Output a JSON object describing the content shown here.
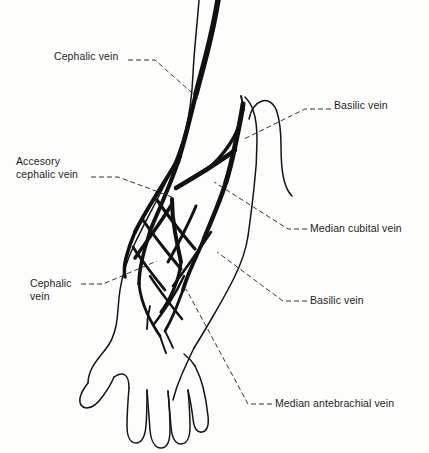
{
  "figure": {
    "background_color": "#fdfdfc",
    "ink_color": "#141414",
    "leader_style": "dashed"
  },
  "labels": [
    {
      "id": "cephalic-vein-upper",
      "text": "Cephalic vein",
      "x": 54,
      "y": 56,
      "anchor": "left"
    },
    {
      "id": "basilic-vein-upper",
      "text": "Basilic vein",
      "x": 334,
      "y": 105,
      "anchor": "left"
    },
    {
      "id": "accessory-cephalic-vein",
      "text": "Accesory\ncephalic vein",
      "x": 16,
      "y": 155,
      "anchor": "left"
    },
    {
      "id": "median-cubital-vein",
      "text": "Median cubital vein",
      "x": 310,
      "y": 222,
      "anchor": "left"
    },
    {
      "id": "cephalic-vein-lower",
      "text": "Cephalic\nvein",
      "x": 30,
      "y": 279,
      "anchor": "left"
    },
    {
      "id": "basilic-vein-lower",
      "text": "Basilic vein",
      "x": 310,
      "y": 295,
      "anchor": "left"
    },
    {
      "id": "median-antebrachial-vein",
      "text": "Median antebrachial vein",
      "x": 275,
      "y": 399,
      "anchor": "left"
    }
  ]
}
